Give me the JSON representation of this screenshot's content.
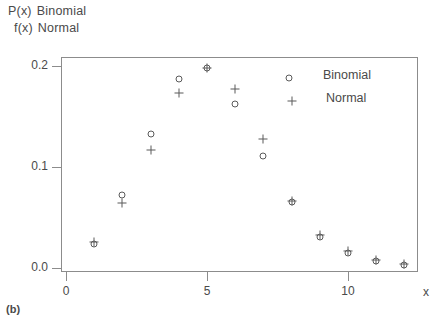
{
  "caption": "(b)",
  "axes": {
    "y_caption_line1_symbol": "P(x)",
    "y_caption_line1_text": "Binomial",
    "y_caption_line2_symbol": "f(x)",
    "y_caption_line2_text": "Normal",
    "x_axis_name": "x"
  },
  "legend": {
    "items": [
      {
        "marker": "circle-marker",
        "label": "Binomial"
      },
      {
        "marker": "plus-marker",
        "label": "Normal"
      }
    ]
  },
  "chart_data": {
    "type": "scatter",
    "title": "",
    "subtitle": "",
    "xlabel": "x",
    "ylabel": "P(x)  Binomial / f(x)  Normal",
    "xlim": [
      0,
      12.65
    ],
    "ylim": [
      0.0,
      0.208
    ],
    "grid": false,
    "legend_position": "top-right-inside",
    "xticks": [
      0,
      5,
      10
    ],
    "xticklabels": [
      "0",
      "5",
      "10"
    ],
    "yticks": [
      0.0,
      0.1,
      0.2
    ],
    "yticklabels": [
      "0.0",
      "0.1",
      "0.2"
    ],
    "x": [
      1,
      2,
      3,
      4,
      5,
      6,
      7,
      8,
      9,
      10,
      11,
      12
    ],
    "series": [
      {
        "name": "Binomial",
        "marker": "circle",
        "values": [
          0.023,
          0.072,
          0.133,
          0.187,
          0.198,
          0.162,
          0.111,
          0.065,
          0.03,
          0.014,
          0.006,
          0.002
        ]
      },
      {
        "name": "Normal",
        "marker": "plus",
        "values": [
          0.025,
          0.064,
          0.117,
          0.173,
          0.198,
          0.177,
          0.128,
          0.066,
          0.032,
          0.016,
          0.007,
          0.003
        ]
      }
    ],
    "annotations": []
  },
  "colors": {
    "marker": "#5a5a5a",
    "frame": "#8c8c8c",
    "text": "#4a4a4a",
    "background": "#ffffff"
  }
}
